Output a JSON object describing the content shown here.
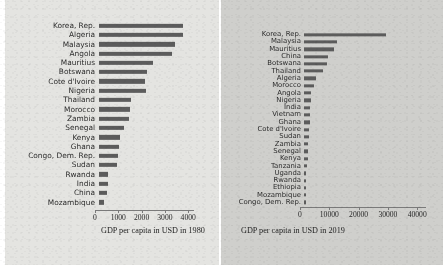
{
  "chart_data": [
    {
      "type": "bar",
      "orientation": "horizontal",
      "id": "gdp-1980",
      "title": "",
      "xlabel": "GDP per capita in USD in 1980",
      "ylabel": "",
      "xlim": [
        0,
        4250
      ],
      "xticks": [
        0,
        1000,
        2000,
        3000,
        4000
      ],
      "xtick_labels": [
        "0",
        "1000",
        "2000",
        "3000",
        "4000"
      ],
      "grid": false,
      "legend": "none",
      "bar_color": "#5c5c5c",
      "categories": [
        "Korea, Rep.",
        "Algeria",
        "Malaysia",
        "Angola",
        "Mauritius",
        "Botswana",
        "Cote d'Ivoire",
        "Nigeria",
        "Thailand",
        "Morocco",
        "Zambia",
        "Senegal",
        "Kenya",
        "Ghana",
        "Congo, Dem. Rep.",
        "Sudan",
        "Rwanda",
        "India",
        "China",
        "Mozambique"
      ],
      "values": [
        3620,
        3600,
        3250,
        3150,
        2300,
        2060,
        1960,
        2020,
        1380,
        1320,
        1280,
        1090,
        900,
        870,
        820,
        790,
        400,
        390,
        330,
        230
      ]
    },
    {
      "type": "bar",
      "orientation": "horizontal",
      "id": "gdp-2019",
      "title": "",
      "xlabel": "GDP per capita in USD in 2019",
      "ylabel": "",
      "xlim": [
        0,
        43000
      ],
      "xticks": [
        0,
        10000,
        20000,
        30000,
        40000
      ],
      "xtick_labels": [
        "0",
        "10000",
        "20000",
        "30000",
        "40000"
      ],
      "grid": false,
      "legend": "none",
      "bar_color": "#5c5c5c",
      "categories": [
        "Korea, Rep.",
        "Malaysia",
        "Mauritius",
        "China",
        "Botswana",
        "Thailand",
        "Algeria",
        "Morocco",
        "Angola",
        "Nigeria",
        "India",
        "Vietnam",
        "Ghana",
        "Cote d'Ivoire",
        "Sudan",
        "Zambia",
        "Senegal",
        "Kenya",
        "Tanzania",
        "Uganda",
        "Rwanda",
        "Ethiopia",
        "Mozambique",
        "Congo, Dem. Rep."
      ],
      "values": [
        28000,
        11400,
        10300,
        8250,
        7850,
        6450,
        4250,
        3350,
        2400,
        2300,
        2150,
        2100,
        1950,
        1850,
        1750,
        1450,
        1400,
        1350,
        1050,
        800,
        800,
        750,
        520,
        520
      ]
    }
  ],
  "figure": {
    "panel_left_label": "GDP per capita chart 1980",
    "panel_right_label": "GDP per capita chart 2019"
  }
}
